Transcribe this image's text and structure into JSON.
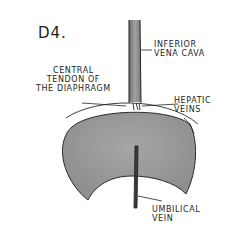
{
  "figure": {
    "title": "D4.",
    "labels": {
      "ivc": [
        "INFERIOR",
        "VENA CAVA"
      ],
      "central_tendon": [
        "CENTRAL",
        "TENDON OF",
        "THE DIAPHRAGM"
      ],
      "hepatic": [
        "HEPATIC",
        "VEINS"
      ],
      "umbilical": [
        "UMBILICAL",
        "VEIN"
      ]
    },
    "colors": {
      "ink": "#1e1e1e",
      "liver_fill": "#9a9a9a",
      "vessel_fill": "#8c8c8c",
      "background": "#ffffff"
    }
  }
}
